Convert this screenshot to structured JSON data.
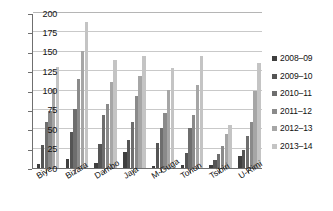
{
  "chart_data": {
    "type": "bar",
    "title": "",
    "xlabel": "",
    "ylabel": "",
    "ylim": [
      0,
      200
    ],
    "yticks": [
      0,
      25,
      50,
      75,
      100,
      125,
      150,
      175,
      200
    ],
    "grid": true,
    "legend_position": "right",
    "categories": [
      "Biye",
      "Bizara",
      "Dambo",
      "Jaja",
      "M-Guga",
      "Tohun",
      "Tsibiri",
      "U-Rimi"
    ],
    "series": [
      {
        "name": "2008–09",
        "color": "#3f3f3f",
        "values": [
          5,
          11,
          6,
          21,
          3,
          4,
          4,
          15
        ]
      },
      {
        "name": "2009–10",
        "color": "#555555",
        "values": [
          30,
          47,
          31,
          36,
          32,
          20,
          10,
          23
        ]
      },
      {
        "name": "2010–11",
        "color": "#6e6e6e",
        "values": [
          59,
          76,
          69,
          59,
          51,
          51,
          18,
          41
        ]
      },
      {
        "name": "2011–12",
        "color": "#8a8a8a",
        "values": [
          74,
          115,
          83,
          93,
          71,
          68,
          29,
          60
        ]
      },
      {
        "name": "2012–13",
        "color": "#a6a6a6",
        "values": [
          102,
          151,
          111,
          119,
          101,
          107,
          44,
          99
        ]
      },
      {
        "name": "2013–14",
        "color": "#c4c4c4",
        "values": [
          130,
          188,
          140,
          144,
          129,
          144,
          55,
          136
        ]
      }
    ]
  }
}
